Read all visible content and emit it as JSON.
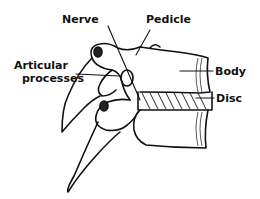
{
  "diagram": {
    "labels": {
      "nerve": "Nerve",
      "pedicle": "Pedicle",
      "articular_1": "Articular",
      "articular_2": "processes",
      "body": "Body",
      "disc": "Disc"
    },
    "colors": {
      "ink": "#111111",
      "background": "#ffffff"
    }
  }
}
